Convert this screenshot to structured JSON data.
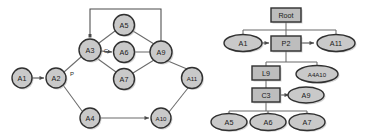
{
  "figure": {
    "title": "",
    "background_color": "#ffffff",
    "node_fill": "#c9c9c9",
    "rect_fill": "#bdbdbd",
    "node_stroke": "#303030",
    "edge_color": "#6b6b6b"
  },
  "left_graph": {
    "name": "dependency-graph",
    "shape": "circle",
    "nodes": [
      {
        "id": "A1",
        "label": "A1",
        "x": 22,
        "y": 78,
        "r": 10
      },
      {
        "id": "A2",
        "label": "A2",
        "x": 56,
        "y": 78,
        "r": 10
      },
      {
        "id": "A3",
        "label": "A3",
        "x": 90,
        "y": 50,
        "r": 11
      },
      {
        "id": "A4",
        "label": "A4",
        "x": 90,
        "y": 118,
        "r": 10
      },
      {
        "id": "A5",
        "label": "A5",
        "x": 124,
        "y": 25,
        "r": 10.5
      },
      {
        "id": "A6",
        "label": "A6",
        "x": 124,
        "y": 52,
        "r": 10.5
      },
      {
        "id": "A7",
        "label": "A7",
        "x": 124,
        "y": 79,
        "r": 10.5
      },
      {
        "id": "A9",
        "label": "A9",
        "x": 161,
        "y": 52,
        "r": 11
      },
      {
        "id": "A10",
        "label": "A10",
        "x": 161,
        "y": 118,
        "r": 10
      },
      {
        "id": "A11",
        "label": "A11",
        "x": 192,
        "y": 78,
        "r": 10.5
      }
    ],
    "edges": [
      {
        "from": "A1",
        "to": "A2",
        "label": ""
      },
      {
        "from": "A2",
        "to": "A3",
        "label": "P"
      },
      {
        "from": "A2",
        "to": "A4",
        "label": ""
      },
      {
        "from": "A3",
        "to": "A5",
        "label": ""
      },
      {
        "from": "A3",
        "to": "A6",
        "label": "C"
      },
      {
        "from": "A3",
        "to": "A7",
        "label": ""
      },
      {
        "from": "A5",
        "to": "A9",
        "label": ""
      },
      {
        "from": "A6",
        "to": "A9",
        "label": ""
      },
      {
        "from": "A7",
        "to": "A9",
        "label": ""
      },
      {
        "from": "A9",
        "to": "A3",
        "label": ""
      },
      {
        "from": "A9",
        "to": "A11",
        "label": ""
      },
      {
        "from": "A4",
        "to": "A10",
        "label": ""
      },
      {
        "from": "A10",
        "to": "A11",
        "label": ""
      }
    ],
    "edge_labels": [
      {
        "text": "P",
        "x": 72,
        "y": 73
      },
      {
        "text": "C",
        "x": 106,
        "y": 51
      }
    ]
  },
  "right_graph": {
    "name": "tree-graph",
    "nodes": [
      {
        "id": "Root",
        "label": "Root",
        "shape": "rect",
        "x": 286,
        "y": 15,
        "w": 30,
        "h": 14
      },
      {
        "id": "A1r",
        "label": "A1",
        "shape": "ellipse",
        "x": 243,
        "y": 43,
        "w": 38,
        "h": 17
      },
      {
        "id": "P2",
        "label": "P2",
        "shape": "rect",
        "x": 286,
        "y": 43,
        "w": 30,
        "h": 15
      },
      {
        "id": "A11r",
        "label": "A11",
        "shape": "ellipse",
        "x": 336,
        "y": 43,
        "w": 38,
        "h": 17
      },
      {
        "id": "L9",
        "label": "L9",
        "shape": "rect",
        "x": 266,
        "y": 73,
        "w": 28,
        "h": 14
      },
      {
        "id": "A4A10",
        "label": "A4A10",
        "shape": "ellipse",
        "x": 317,
        "y": 74,
        "w": 42,
        "h": 17
      },
      {
        "id": "C3",
        "label": "C3",
        "shape": "rect",
        "x": 266,
        "y": 95,
        "w": 28,
        "h": 14
      },
      {
        "id": "A9r",
        "label": "A9",
        "shape": "ellipse",
        "x": 306,
        "y": 95,
        "w": 36,
        "h": 16
      },
      {
        "id": "A5r",
        "label": "A5",
        "shape": "ellipse",
        "x": 229,
        "y": 122,
        "w": 36,
        "h": 17
      },
      {
        "id": "A6r",
        "label": "A6",
        "shape": "ellipse",
        "x": 268,
        "y": 122,
        "w": 36,
        "h": 17
      },
      {
        "id": "A7r",
        "label": "A7",
        "shape": "ellipse",
        "x": 307,
        "y": 122,
        "w": 36,
        "h": 17
      }
    ],
    "edges": [
      {
        "from": "Root",
        "to": "A1r"
      },
      {
        "from": "Root",
        "to": "P2"
      },
      {
        "from": "Root",
        "to": "A11r"
      },
      {
        "from": "A1r",
        "to": "P2"
      },
      {
        "from": "P2",
        "to": "A11r"
      },
      {
        "from": "P2",
        "to": "L9"
      },
      {
        "from": "P2",
        "to": "A4A10"
      },
      {
        "from": "L9",
        "to": "C3"
      },
      {
        "from": "C3",
        "to": "A9r"
      },
      {
        "from": "C3",
        "to": "A5r"
      },
      {
        "from": "C3",
        "to": "A6r"
      },
      {
        "from": "C3",
        "to": "A7r"
      }
    ]
  }
}
